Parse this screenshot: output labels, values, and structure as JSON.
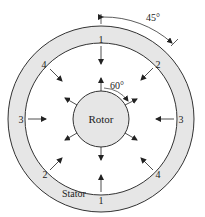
{
  "diagram": {
    "colors": {
      "stator_fill": "#e6e6e6",
      "rotor_fill": "#e6e6e6",
      "line": "#333333",
      "background": "#ffffff"
    },
    "rotor_label": "Rotor",
    "stator_label": "Stator",
    "angle_stator": "45°",
    "angle_rotor": "60°",
    "stator_pole_labels": {
      "top": "1",
      "bottom": "1",
      "left": "3",
      "right": "3",
      "upper_left": "4",
      "lower_right": "4",
      "upper_right": "2",
      "lower_left": "2"
    }
  }
}
